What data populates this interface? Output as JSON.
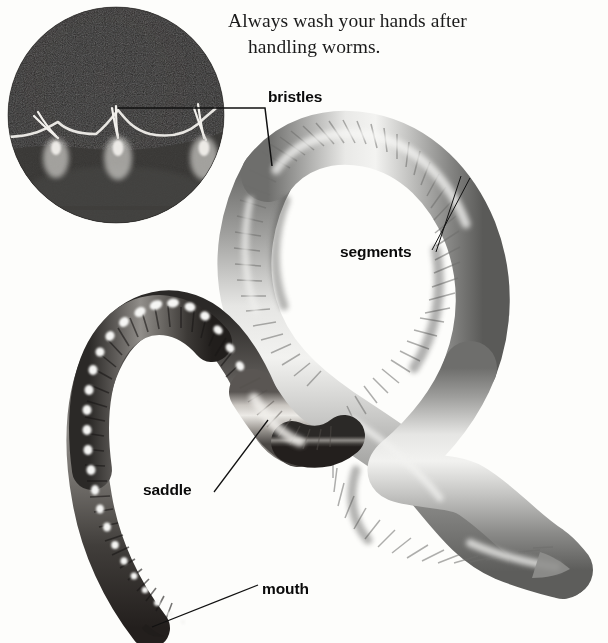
{
  "figure": {
    "type": "labeled-photo-diagram",
    "background_color": "#fdfdfb",
    "caption": {
      "line1": "Always wash your hands after",
      "line2": "handling worms."
    },
    "labels": [
      {
        "id": "bristles",
        "text": "bristles",
        "points_to": "setae in circular micrograph inset"
      },
      {
        "id": "segments",
        "text": "segments",
        "points_to": "transverse rings on upper worm body"
      },
      {
        "id": "saddle",
        "text": "saddle",
        "points_to": "clitellum band on lower-left worm"
      },
      {
        "id": "mouth",
        "text": "mouth",
        "points_to": "anterior tip of lower-left worm"
      }
    ],
    "inset": {
      "name": "bristles-micrograph",
      "shape": "circle",
      "description": "dark magnified photograph of worm underside showing pale bristles",
      "background_color": "#242424",
      "bristle_count": 3
    },
    "worms": [
      {
        "name": "upper-worm",
        "description": "large pale grey worm coiled in an S shape with fine segment rings",
        "tone": "light-grey",
        "tail": "tapered point at lower right"
      },
      {
        "name": "lower-worm",
        "description": "darker worm hooked to the left with bright highlight flecks and a pale saddle",
        "tone": "dark-grey",
        "head": "tapered mouth end at bottom"
      }
    ]
  }
}
